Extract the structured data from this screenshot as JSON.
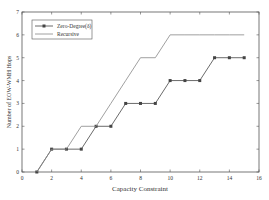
{
  "chart_data": {
    "type": "line",
    "title": "",
    "xlabel": "Capacity Constraint",
    "ylabel": "Number of EOW-WMH Hops",
    "xlim": [
      0,
      16
    ],
    "ylim": [
      0,
      7
    ],
    "xticks": [
      0,
      2,
      4,
      6,
      8,
      10,
      12,
      14,
      16
    ],
    "yticks": [
      0,
      1,
      2,
      3,
      4,
      5,
      6,
      7
    ],
    "grid": false,
    "legend_position": "upper left",
    "x": [
      1,
      2,
      3,
      4,
      5,
      6,
      7,
      8,
      9,
      10,
      11,
      12,
      13,
      14,
      15
    ],
    "series": [
      {
        "name": "Zero-Degree(δ)",
        "marker": "square",
        "color": "#444444",
        "values": [
          0,
          1,
          1,
          1,
          2,
          2,
          3,
          3,
          3,
          4,
          4,
          4,
          5,
          5,
          5
        ]
      },
      {
        "name": "Recursive",
        "marker": "none",
        "color": "#888888",
        "values": [
          0,
          1,
          1,
          2,
          2,
          3,
          4,
          5,
          5,
          6,
          6,
          6,
          6,
          6,
          6
        ]
      }
    ]
  }
}
